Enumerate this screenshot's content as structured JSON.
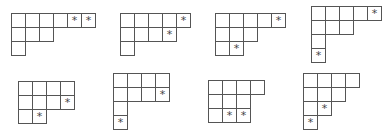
{
  "figure": {
    "cell_size": 14,
    "star_symbol": "*",
    "line_color": "#555555",
    "diagrams": [
      {
        "id": "d1",
        "x": 11,
        "y": 13,
        "rows": [
          6,
          3,
          1
        ],
        "stars": [
          [
            0,
            4
          ],
          [
            0,
            5
          ]
        ]
      },
      {
        "id": "d2",
        "x": 120,
        "y": 13,
        "rows": [
          5,
          4,
          1
        ],
        "stars": [
          [
            0,
            4
          ],
          [
            1,
            3
          ]
        ]
      },
      {
        "id": "d3",
        "x": 215,
        "y": 13,
        "rows": [
          5,
          3,
          2
        ],
        "stars": [
          [
            0,
            4
          ],
          [
            2,
            1
          ]
        ]
      },
      {
        "id": "d4",
        "x": 311,
        "y": 6,
        "rows": [
          5,
          3,
          1,
          1
        ],
        "stars": [
          [
            0,
            4
          ],
          [
            3,
            0
          ]
        ]
      },
      {
        "id": "d5",
        "x": 18,
        "y": 81,
        "rows": [
          4,
          4,
          2
        ],
        "stars": [
          [
            1,
            3
          ],
          [
            2,
            1
          ]
        ]
      },
      {
        "id": "d6",
        "x": 113,
        "y": 73,
        "rows": [
          4,
          4,
          1,
          1
        ],
        "stars": [
          [
            1,
            3
          ],
          [
            3,
            0
          ]
        ]
      },
      {
        "id": "d7",
        "x": 208,
        "y": 80,
        "rows": [
          4,
          3,
          3
        ],
        "stars": [
          [
            2,
            1
          ],
          [
            2,
            2
          ]
        ]
      },
      {
        "id": "d8",
        "x": 303,
        "y": 73,
        "rows": [
          4,
          3,
          2,
          1
        ],
        "stars": [
          [
            2,
            1
          ],
          [
            3,
            0
          ]
        ]
      }
    ]
  }
}
